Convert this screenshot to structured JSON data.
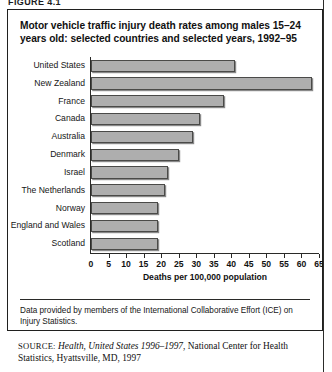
{
  "figure_tag": "FIGURE 4.1",
  "title": "Motor vehicle traffic injury death rates among males 15–24 years old: selected countries and selected years, 1992–95",
  "footnote": "Data provided by members of the International Collaborative Effort (ICE) on Injury Statistics.",
  "source": {
    "label": "SOURCE:",
    "italic_part": "Health, United States 1996–1997",
    "rest": ", National Center for Health Statistics, Hyattsville, MD, 1997"
  },
  "colors": {
    "bar_fill": "#aeaeae",
    "bar_stroke": "#4a4a48",
    "axis": "#2a2a28",
    "text": "#161616",
    "background": "#ffffff"
  },
  "chart_data": {
    "type": "bar",
    "orientation": "horizontal",
    "title": "Motor vehicle traffic injury death rates among males 15–24 years old: selected countries and selected years, 1992–95",
    "xlabel": "Deaths per 100,000 population",
    "ylabel": "",
    "xlim": [
      0,
      65
    ],
    "xticks": [
      0,
      5,
      10,
      15,
      20,
      25,
      30,
      35,
      40,
      45,
      50,
      55,
      60,
      65
    ],
    "xtick_labels": [
      "0",
      "5",
      "10",
      "15",
      "20",
      "25",
      "30",
      "35",
      "40",
      "45",
      "50",
      "55",
      "60",
      "65"
    ],
    "grid": false,
    "legend": false,
    "categories": [
      "United States",
      "New Zealand",
      "France",
      "Canada",
      "Australia",
      "Denmark",
      "Israel",
      "The Netherlands",
      "Norway",
      "England and Wales",
      "Scotland"
    ],
    "values": [
      41,
      63,
      38,
      31,
      29,
      25,
      22,
      21,
      19,
      19,
      19
    ]
  }
}
